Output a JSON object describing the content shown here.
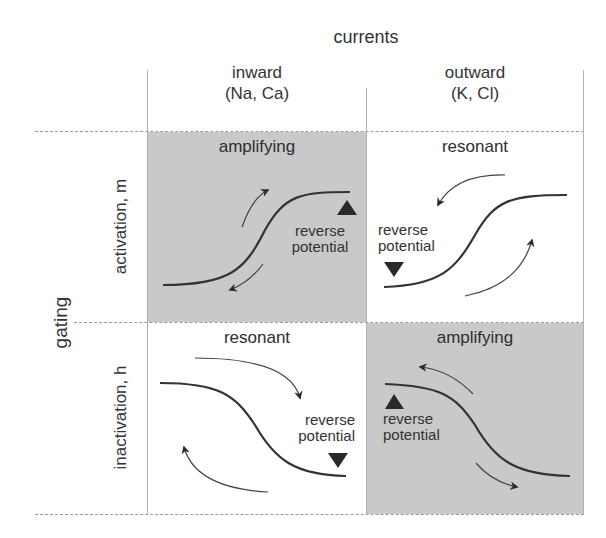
{
  "title": "currents",
  "columns": [
    {
      "label": "inward",
      "sub": "(Na, Ca)"
    },
    {
      "label": "outward",
      "sub": "(K, Cl)"
    }
  ],
  "row_axis": "gating",
  "rows": [
    {
      "label": "activation, m"
    },
    {
      "label": "inactivation, h"
    }
  ],
  "cells": {
    "activation_inward": {
      "title": "amplifying",
      "marker": "reverse potential",
      "shaded": true,
      "marker_dir": "up"
    },
    "activation_outward": {
      "title": "resonant",
      "marker": "reverse potential",
      "shaded": false,
      "marker_dir": "down"
    },
    "inactivation_inward": {
      "title": "resonant",
      "marker": "reverse potential",
      "shaded": false,
      "marker_dir": "down"
    },
    "inactivation_outward": {
      "title": "amplifying",
      "marker": "reverse potential",
      "shaded": true,
      "marker_dir": "up"
    }
  },
  "rev_line1": "reverse",
  "rev_line2": "potential",
  "colors": {
    "shade": "#c9c9c9",
    "ink": "#2a2a2a",
    "grid": "#9a9a9a"
  }
}
